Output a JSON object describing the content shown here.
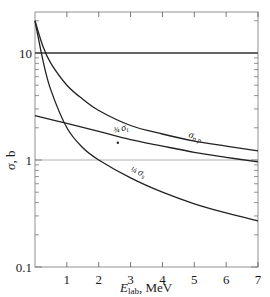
{
  "chart_data": {
    "type": "line",
    "title": "",
    "xlabel": "E_lab, MeV",
    "ylabel": "σ, b",
    "xscale": "linear",
    "yscale": "log",
    "xlim": [
      0,
      7
    ],
    "ylim": [
      0.1,
      24
    ],
    "x_ticks": [
      "1",
      "2",
      "3",
      "4",
      "5",
      "6",
      "7"
    ],
    "y_ticks": [
      "0.1",
      "1",
      "10"
    ],
    "grid": false,
    "reference_lines": [
      {
        "y": 10,
        "orientation": "horizontal"
      },
      {
        "y": 1,
        "orientation": "horizontal"
      }
    ],
    "series": [
      {
        "name": "σ_np",
        "label": "σnp",
        "x": [
          0.0,
          0.25,
          0.5,
          1.0,
          1.5,
          2.0,
          3.0,
          4.0,
          5.0,
          6.0,
          7.0
        ],
        "values": [
          20.0,
          11.5,
          8.0,
          5.0,
          3.7,
          2.9,
          2.1,
          1.75,
          1.5,
          1.35,
          1.22
        ]
      },
      {
        "name": "(3/4)σ_t",
        "label": "¾ σt",
        "x": [
          0.0,
          1.0,
          2.0,
          3.0,
          4.0,
          5.0,
          6.0,
          7.0
        ],
        "values": [
          2.6,
          2.2,
          1.85,
          1.55,
          1.35,
          1.18,
          1.06,
          0.96
        ]
      },
      {
        "name": "(1/4)σ_s",
        "label": "¼ σs",
        "x": [
          0.0,
          0.25,
          0.5,
          1.0,
          1.5,
          2.0,
          3.0,
          4.0,
          5.0,
          6.0,
          7.0
        ],
        "values": [
          20.0,
          8.5,
          4.5,
          2.0,
          1.3,
          1.0,
          0.68,
          0.5,
          0.39,
          0.32,
          0.27
        ]
      }
    ],
    "annotations": [
      {
        "type": "point",
        "x": 2.6,
        "y": 1.45
      }
    ]
  },
  "axes": {
    "y_title_symbol": "σ",
    "y_title_unit": ", b",
    "x_title_symbol": "E",
    "x_title_sub": "lab",
    "x_title_unit": ", MeV"
  },
  "labels": {
    "np_main": "σ",
    "np_sub": "n p",
    "t_frac": "¾",
    "t_main": "σ",
    "t_sub": "t",
    "s_frac": "¼",
    "s_main": "σ",
    "s_sub": "s"
  }
}
